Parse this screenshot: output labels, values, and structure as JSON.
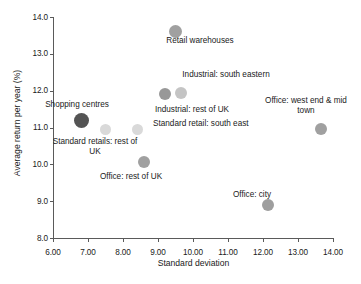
{
  "chart_data": {
    "type": "scatter",
    "title": "",
    "xlabel": "Standard deviation",
    "ylabel": "Average return per year (%)",
    "xlim": [
      6.0,
      14.0
    ],
    "ylim": [
      8.0,
      14.0
    ],
    "xticks": [
      "6.00",
      "7.00",
      "8.00",
      "9.00",
      "10.00",
      "11.00",
      "12.00",
      "13.00",
      "14.00"
    ],
    "xtick_values": [
      6,
      7,
      8,
      9,
      10,
      11,
      12,
      13,
      14
    ],
    "yticks": [
      "8.0",
      "9.0",
      "10.0",
      "11.0",
      "12.0",
      "13.0",
      "14.0"
    ],
    "ytick_values": [
      8,
      9,
      10,
      11,
      12,
      13,
      14
    ],
    "grid": false,
    "legend": "none",
    "points": [
      {
        "label": "Retail warehouses",
        "x": 9.5,
        "y": 13.6,
        "color": "#a0a0a0",
        "size": 13,
        "label_pos": "below",
        "label_align": "center",
        "label_left": 150,
        "label_top": 36,
        "label_width": 100
      },
      {
        "label": "Industrial: south eastern",
        "x": 9.65,
        "y": 11.95,
        "color": "#c4c4c4",
        "size": 12,
        "label_pos": "above",
        "label_align": "center",
        "label_left": 168,
        "label_top": 70,
        "label_width": 116
      },
      {
        "label": "Industrial: rest of UK",
        "x": 9.2,
        "y": 11.9,
        "color": "#989898",
        "size": 12,
        "label_pos": "below",
        "label_align": "center",
        "label_left": 142,
        "label_top": 105,
        "label_width": 100
      },
      {
        "label": "Shopping centres",
        "x": 6.8,
        "y": 11.2,
        "color": "#545454",
        "size": 15,
        "label_pos": "above",
        "label_align": "center",
        "label_left": 34,
        "label_top": 100,
        "label_width": 86
      },
      {
        "label": "Standard retails: rest of\nUK",
        "x": 7.5,
        "y": 10.95,
        "color": "#d9d9d9",
        "size": 11,
        "label_pos": "below",
        "label_align": "center",
        "label_left": 48,
        "label_top": 137,
        "label_width": 94
      },
      {
        "label": "Standard retail: south east",
        "x": 8.4,
        "y": 10.95,
        "color": "#d9d9d9",
        "size": 11,
        "label_pos": "right",
        "label_align": "left",
        "label_left": 153,
        "label_top": 119,
        "label_width": 124
      },
      {
        "label": "Office: west end & mid\ntown",
        "x": 13.65,
        "y": 10.95,
        "color": "#a0a0a0",
        "size": 12,
        "label_pos": "above",
        "label_align": "center",
        "label_left": 254,
        "label_top": 96,
        "label_width": 104
      },
      {
        "label": "Office: rest of UK",
        "x": 8.6,
        "y": 10.05,
        "color": "#a0a0a0",
        "size": 12,
        "label_pos": "below",
        "label_align": "center",
        "label_left": 85,
        "label_top": 172,
        "label_width": 92
      },
      {
        "label": "Office: city",
        "x": 12.15,
        "y": 8.9,
        "color": "#9e9e9e",
        "size": 12,
        "label_pos": "above",
        "label_align": "center",
        "label_left": 216,
        "label_top": 190,
        "label_width": 72
      }
    ]
  },
  "axis_color": "#5a5a5a",
  "text_color": "#1a1a1a",
  "background": "#ffffff"
}
